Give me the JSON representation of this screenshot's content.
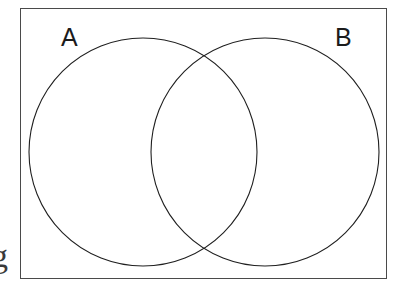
{
  "figure": {
    "type": "venn-diagram",
    "background_color": "#ffffff",
    "frame": {
      "stroke_color": "#4a4a4a",
      "stroke_width": 1.2,
      "x": 20,
      "y": 8,
      "width": 367,
      "height": 271
    },
    "labels": {
      "set_a": "A",
      "set_b": "B"
    },
    "edge_glyph": {
      "text": "g",
      "note": "partial character cropped at left edge"
    }
  },
  "chart_data": {
    "type": "venn",
    "title": "",
    "xlabel": "",
    "ylabel": "",
    "sets": [
      {
        "name": "A",
        "label": "A",
        "cx": 143,
        "cy": 152,
        "r": 114,
        "fill": "none",
        "stroke": "#1f1f1f",
        "stroke_width": 1.1,
        "label_x": 70,
        "label_y": 40
      },
      {
        "name": "B",
        "label": "B",
        "cx": 265,
        "cy": 152,
        "r": 114,
        "fill": "none",
        "stroke": "#1f1f1f",
        "stroke_width": 1.1,
        "label_x": 343,
        "label_y": 40
      }
    ],
    "intersections": [
      {
        "sets": [
          "A",
          "B"
        ],
        "label": "",
        "x": 204,
        "y": 152
      }
    ],
    "intersection_points": [
      {
        "x": 204,
        "y": 63
      },
      {
        "x": 204,
        "y": 248
      }
    ],
    "universe_label": "",
    "grid": false,
    "legend": "none"
  }
}
